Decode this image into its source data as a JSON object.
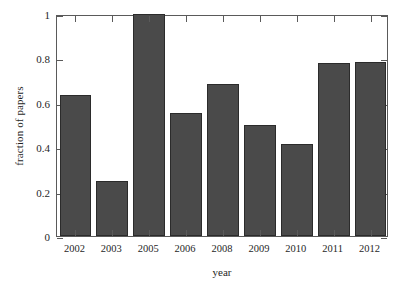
{
  "chart_data": {
    "type": "bar",
    "title": "",
    "xlabel": "year",
    "ylabel": "fraction of papers",
    "categories": [
      "2002",
      "2003",
      "2005",
      "2006",
      "2008",
      "2009",
      "2010",
      "2011",
      "2012"
    ],
    "values": [
      0.635,
      0.25,
      1.0,
      0.555,
      0.685,
      0.5,
      0.415,
      0.78,
      0.785
    ],
    "ylim": [
      0,
      1
    ],
    "xlim_note": "categorical",
    "ytick_labels": [
      "0",
      "0.2",
      "0.4",
      "0.6",
      "0.8",
      "1"
    ],
    "ytick_values": [
      0,
      0.2,
      0.4,
      0.6,
      0.8,
      1
    ],
    "grid": false,
    "legend": null,
    "legend_position": "none",
    "series": [
      {
        "name": "fraction of papers",
        "values": [
          0.635,
          0.25,
          1.0,
          0.555,
          0.685,
          0.5,
          0.415,
          0.78,
          0.785
        ]
      }
    ],
    "colors": {
      "bar_fill": "#4a4a4a",
      "bar_edge": "#2b2b2b",
      "axis": "#5a5a5a",
      "text": "#1f1f1f",
      "background": "#ffffff"
    }
  }
}
